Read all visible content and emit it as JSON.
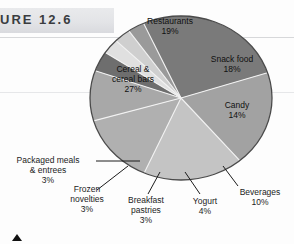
{
  "figure": {
    "band_label": "URE 12.6",
    "marker_icon": "up-triangle-marker"
  },
  "chart_data": {
    "type": "pie",
    "title": "",
    "subtitle": "",
    "xlabel": "",
    "ylabel": "",
    "grid": false,
    "legend_position": "none",
    "units": "percent",
    "start_angle_deg": 18,
    "direction": "clockwise",
    "categories": [
      "Restaurants",
      "Snack food",
      "Candy",
      "Beverages",
      "Yogurt",
      "Breakfast pastries",
      "Frozen novelties",
      "Packaged meals & entrees",
      "Cereal & cereal bars"
    ],
    "values": [
      19,
      18,
      14,
      10,
      4,
      3,
      3,
      3,
      27
    ],
    "labels": [
      "Restaurants",
      "Snack food",
      "Candy",
      "Beverages",
      "Yogurt",
      "Breakfast pastries",
      "Frozen novelties",
      "Packaged meals & entrees",
      "Cereal & cereal bars"
    ],
    "value_labels": [
      "19%",
      "18%",
      "14%",
      "10%",
      "4%",
      "3%",
      "3%",
      "3%",
      "27%"
    ],
    "colors": [
      "#a2a2a2",
      "#c4c4c4",
      "#b0b0b0",
      "#a8a8a8",
      "#6e6e6e",
      "#e0e0e0",
      "#cfcfcf",
      "#9a9a9a",
      "#7a7a7a"
    ],
    "slice_outline_color": "#ffffff",
    "pie_outline_color": "#4a4a4a"
  },
  "slices": {
    "restaurants": {
      "name": "Restaurants",
      "pct": "19%"
    },
    "snack_food": {
      "name": "Snack food",
      "pct": "18%"
    },
    "candy": {
      "name": "Candy",
      "pct": "14%"
    },
    "beverages": {
      "name": "Beverages",
      "pct": "10%"
    },
    "yogurt": {
      "name": "Yogurt",
      "pct": "4%"
    },
    "breakfast": {
      "name": "Breakfast pastries",
      "pct": "3%"
    },
    "frozen": {
      "name": "Frozen novelties",
      "pct": "3%"
    },
    "packaged_l1": {
      "name": "Packaged meals",
      "l2": "& entrees",
      "pct": "3%"
    },
    "cereal_l1": {
      "name": "Cereal &",
      "l2": "cereal bars",
      "pct": "27%"
    }
  }
}
